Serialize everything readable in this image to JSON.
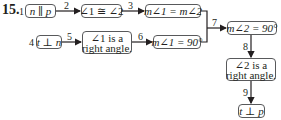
{
  "problem_number": "15.",
  "nodes": {
    "n1": {
      "step": "1",
      "text": "n ∥ p"
    },
    "n2": {
      "text": "∠1 ≅ ∠2"
    },
    "n3": {
      "text": "m∠1 = m∠2"
    },
    "n4": {
      "step": "4",
      "text": "t ⊥ n"
    },
    "n5": {
      "line1": "∠1 is a",
      "line2": "right angle."
    },
    "n6": {
      "text": "m∠1 = 90°"
    },
    "n7": {
      "text": "m∠2 = 90°"
    },
    "n8": {
      "line1": "∠2 is a",
      "line2": "right angle."
    },
    "n9": {
      "text": "t ⊥ p"
    }
  },
  "arrows": {
    "a2": "2",
    "a3": "3",
    "a5": "5",
    "a6": "6",
    "a7": "7",
    "a8": "8",
    "a9": "9"
  },
  "colors": {
    "stroke": "#231f20",
    "box_border": "#58595b"
  }
}
